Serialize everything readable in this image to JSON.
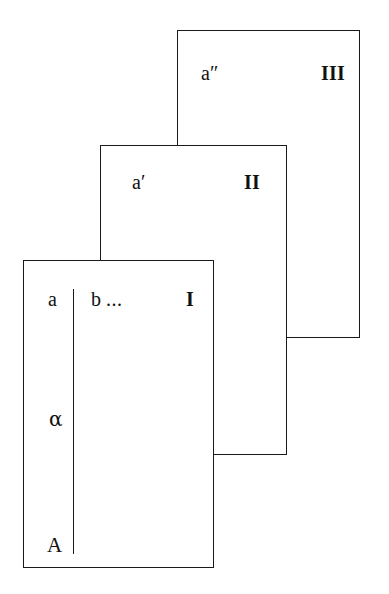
{
  "diagram": {
    "background_color": "#ffffff",
    "stroke_color": "#1a1a1a",
    "text_color": "#111111"
  },
  "cards": [
    {
      "id": "card-3",
      "roman_numeral": "III",
      "symbol": "a″",
      "symbol_base": "a",
      "symbol_prime": "″",
      "position": {
        "left": 177,
        "top": 30,
        "width": 183,
        "height": 308
      }
    },
    {
      "id": "card-2",
      "roman_numeral": "II",
      "symbol": "a′",
      "symbol_base": "a",
      "symbol_prime": "′",
      "position": {
        "left": 100,
        "top": 145,
        "width": 187,
        "height": 310
      }
    },
    {
      "id": "card-1",
      "roman_numeral": "I",
      "symbol": "a",
      "symbol_base": "a",
      "symbol_prime": "",
      "position": {
        "left": 23,
        "top": 260,
        "width": 191,
        "height": 308
      }
    }
  ],
  "front_card_contents": {
    "left_column_labels": [
      "a",
      "α",
      "A"
    ],
    "label_lowercase_a": "a",
    "label_alpha": "α",
    "label_uppercase_a": "A",
    "right_column_label": "b ...",
    "right_column_text": "b",
    "right_column_ellipsis": "...",
    "divider": {
      "x": 72,
      "top": 288,
      "bottom": 553
    }
  }
}
